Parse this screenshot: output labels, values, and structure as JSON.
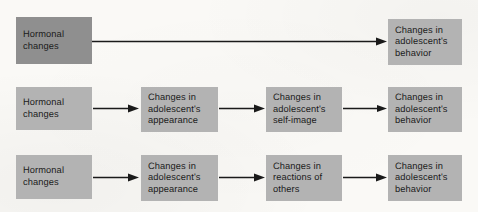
{
  "diagram": {
    "background_color": "#faf9f6",
    "box_color": "#b3b3b3",
    "box_color_dark": "#8f8f8f",
    "arrow_color": "#1a1a1a",
    "rows": [
      {
        "id": "row-1",
        "label": "Direct effect pathway",
        "boxes": [
          {
            "id": "r1-b1",
            "name": "hormonal-changes",
            "shade": "dark",
            "lines": [
              "Hormonal",
              "changes"
            ]
          },
          {
            "id": "r1-b2",
            "name": "changes-in-adolescents-behavior",
            "shade": "light",
            "lines": [
              "Changes in",
              "adolescent's",
              "behavior"
            ]
          }
        ],
        "arrows": [
          {
            "id": "r1-a1",
            "from": "r1-b1",
            "to": "r1-b2"
          }
        ]
      },
      {
        "id": "row-2",
        "label": "Self-image mediated pathway",
        "boxes": [
          {
            "id": "r2-b1",
            "name": "hormonal-changes",
            "shade": "light",
            "lines": [
              "Hormonal",
              "changes"
            ]
          },
          {
            "id": "r2-b2",
            "name": "changes-in-adolescents-appearance",
            "shade": "light",
            "lines": [
              "Changes in",
              "adolescent's",
              "appearance"
            ]
          },
          {
            "id": "r2-b3",
            "name": "changes-in-adolescents-self-image",
            "shade": "light",
            "lines": [
              "Changes in",
              "adolescent's",
              "self-image"
            ]
          },
          {
            "id": "r2-b4",
            "name": "changes-in-adolescents-behavior",
            "shade": "light",
            "lines": [
              "Changes in",
              "adolescent's",
              "behavior"
            ]
          }
        ],
        "arrows": [
          {
            "id": "r2-a1",
            "from": "r2-b1",
            "to": "r2-b2"
          },
          {
            "id": "r2-a2",
            "from": "r2-b2",
            "to": "r2-b3"
          },
          {
            "id": "r2-a3",
            "from": "r2-b3",
            "to": "r2-b4"
          }
        ]
      },
      {
        "id": "row-3",
        "label": "Reactions of others mediated pathway",
        "boxes": [
          {
            "id": "r3-b1",
            "name": "hormonal-changes",
            "shade": "light",
            "lines": [
              "Hormonal",
              "changes"
            ]
          },
          {
            "id": "r3-b2",
            "name": "changes-in-adolescents-appearance",
            "shade": "light",
            "lines": [
              "Changes in",
              "adolescent's",
              "appearance"
            ]
          },
          {
            "id": "r3-b3",
            "name": "changes-in-reactions-of-others",
            "shade": "light",
            "lines": [
              "Changes in",
              "reactions of",
              "others"
            ]
          },
          {
            "id": "r3-b4",
            "name": "changes-in-adolescents-behavior",
            "shade": "light",
            "lines": [
              "Changes in",
              "adolescent's",
              "behavior"
            ]
          }
        ],
        "arrows": [
          {
            "id": "r3-a1",
            "from": "r3-b1",
            "to": "r3-b2"
          },
          {
            "id": "r3-a2",
            "from": "r3-b2",
            "to": "r3-b3"
          },
          {
            "id": "r3-a3",
            "from": "r3-b3",
            "to": "r3-b4"
          }
        ]
      }
    ]
  }
}
